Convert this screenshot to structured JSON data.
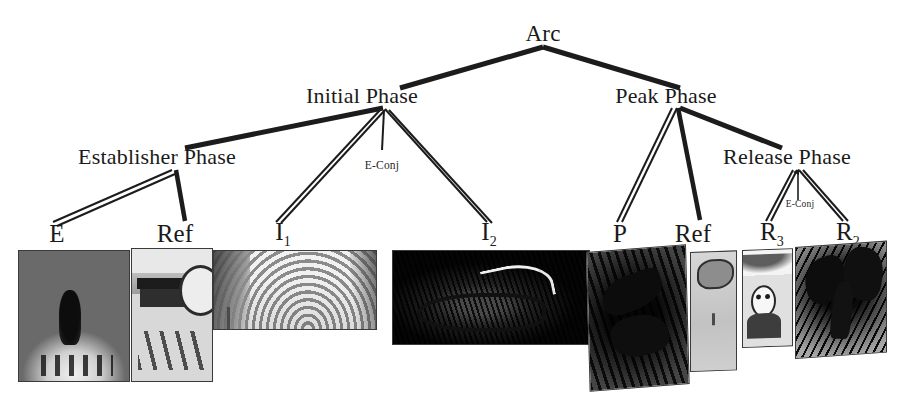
{
  "diagram": {
    "type": "visual-narrative-grammar-tree",
    "title_node": "Arc",
    "nodes": [
      {
        "id": "arc",
        "label": "Arc",
        "level": 0,
        "x": 543,
        "y": 34
      },
      {
        "id": "initial",
        "label": "Initial Phase",
        "level": 1,
        "x": 362,
        "y": 96
      },
      {
        "id": "peak",
        "label": "Peak Phase",
        "level": 1,
        "x": 666,
        "y": 96
      },
      {
        "id": "establisher",
        "label": "Establisher Phase",
        "level": 2,
        "x": 157,
        "y": 157
      },
      {
        "id": "release",
        "label": "Release Phase",
        "level": 2,
        "x": 787,
        "y": 157
      },
      {
        "id": "leaf_e",
        "label": "E",
        "level": 3,
        "x": 57,
        "y": 234
      },
      {
        "id": "leaf_ref1",
        "label": "Ref",
        "level": 3,
        "x": 175,
        "y": 234
      },
      {
        "id": "leaf_i1",
        "label": "I",
        "sub": "1",
        "level": 3,
        "x": 283,
        "y": 234
      },
      {
        "id": "leaf_i2",
        "label": "I",
        "sub": "2",
        "level": 3,
        "x": 489,
        "y": 234
      },
      {
        "id": "leaf_p",
        "label": "P",
        "level": 3,
        "x": 620,
        "y": 234
      },
      {
        "id": "leaf_ref2",
        "label": "Ref",
        "level": 3,
        "x": 693,
        "y": 234
      },
      {
        "id": "leaf_r3",
        "label": "R",
        "sub": "3",
        "level": 3,
        "x": 772,
        "y": 234
      },
      {
        "id": "leaf_r2",
        "label": "R",
        "sub": "2",
        "level": 3,
        "x": 848,
        "y": 234
      }
    ],
    "edges": [
      {
        "from": "arc",
        "to": "initial",
        "style": "single-thick"
      },
      {
        "from": "arc",
        "to": "peak",
        "style": "single-thick"
      },
      {
        "from": "initial",
        "to": "establisher",
        "style": "single-thick"
      },
      {
        "from": "initial",
        "to": "leaf_i1",
        "style": "double"
      },
      {
        "from": "initial",
        "to": "leaf_i2",
        "style": "double"
      },
      {
        "from": "peak",
        "to": "leaf_p",
        "style": "double"
      },
      {
        "from": "peak",
        "to": "leaf_ref2",
        "style": "single-thick"
      },
      {
        "from": "peak",
        "to": "release",
        "style": "single-thick"
      },
      {
        "from": "establisher",
        "to": "leaf_e",
        "style": "double"
      },
      {
        "from": "establisher",
        "to": "leaf_ref1",
        "style": "single-thick"
      },
      {
        "from": "release",
        "to": "leaf_r3",
        "style": "double"
      },
      {
        "from": "release",
        "to": "leaf_r2",
        "style": "double"
      }
    ],
    "conjunction_markers": [
      {
        "id": "econj_initial",
        "label": "E-Conj",
        "parent": "initial",
        "x": 382,
        "y": 159,
        "size": "normal"
      },
      {
        "id": "econj_release",
        "label": "E-Conj",
        "parent": "release",
        "x": 798,
        "y": 200,
        "size": "small"
      }
    ],
    "panels": [
      {
        "id": "panel_e",
        "for": "leaf_e",
        "caption": "E",
        "kind": "comic-panel-dark-forest-path",
        "x": 18,
        "y": 250,
        "w": 110,
        "h": 130,
        "skew": 0
      },
      {
        "id": "panel_ref1",
        "for": "leaf_ref1",
        "caption": "Ref",
        "kind": "comic-panel-bench-footprints",
        "x": 131,
        "y": 248,
        "w": 80,
        "h": 132,
        "skew": 0
      },
      {
        "id": "panel_i1",
        "for": "leaf_i1",
        "caption": "I1",
        "kind": "comic-panel-swirl-wide",
        "x": 213,
        "y": 250,
        "w": 162,
        "h": 78,
        "skew": 0
      },
      {
        "id": "panel_i2",
        "for": "leaf_i2",
        "caption": "I2",
        "kind": "comic-panel-creature-wide",
        "x": 392,
        "y": 250,
        "w": 196,
        "h": 93,
        "skew": 0
      },
      {
        "id": "panel_p",
        "for": "leaf_p",
        "caption": "P",
        "kind": "comic-panel-dark-motion",
        "x": 586,
        "y": 252,
        "w": 98,
        "h": 138,
        "skew": -3
      },
      {
        "id": "panel_ref2",
        "for": "leaf_ref2",
        "caption": "Ref",
        "kind": "comic-panel-narrow-light",
        "x": 690,
        "y": 252,
        "w": 45,
        "h": 118,
        "skew": -2
      },
      {
        "id": "panel_r3",
        "for": "leaf_r3",
        "caption": "R3",
        "kind": "comic-panel-face-closeup",
        "x": 742,
        "y": 250,
        "w": 49,
        "h": 96,
        "skew": -2
      },
      {
        "id": "panel_r2",
        "for": "leaf_r2",
        "caption": "R2",
        "kind": "comic-panel-dark-tree",
        "x": 795,
        "y": 247,
        "w": 90,
        "h": 110,
        "skew": -3
      }
    ],
    "colors": {
      "line": "#1c1c1c",
      "text": "#1a1a1a",
      "background": "#ffffff"
    }
  }
}
